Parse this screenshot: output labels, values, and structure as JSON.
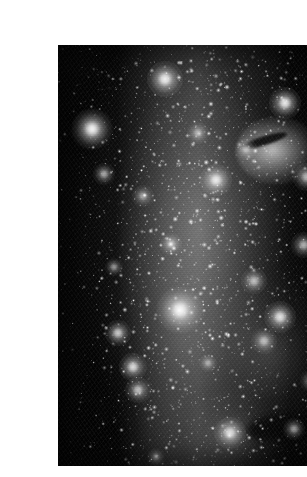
{
  "page": {
    "background_color": "#ffffff",
    "width": 307,
    "height": 477
  },
  "figure": {
    "name": "astronomical-star-field",
    "caption": "",
    "media_type": "grayscale astronomical photograph",
    "frame": {
      "x": 18,
      "y": 29,
      "width": 270,
      "height": 421
    },
    "palette": {
      "sky_background": "#050505",
      "nebula_glow": "#8c8c8c",
      "star_core": "#ffffff",
      "dark_lane": "#050505",
      "page_white": "#ffffff"
    },
    "features": [
      {
        "name": "central-milky-band",
        "x_pct": 52,
        "y_pct": 44,
        "brightness": "bright"
      },
      {
        "name": "hii-knot-upper-right",
        "x_pct": 80,
        "y_pct": 25,
        "brightness": "brightest"
      },
      {
        "name": "dark-absorption-lane",
        "x_pct": 76,
        "y_pct": 23,
        "brightness": "dark"
      },
      {
        "name": "bright-star-center",
        "x_pct": 45,
        "y_pct": 55,
        "brightness": "brightest"
      },
      {
        "name": "star-cluster-lower-left",
        "x_pct": 27,
        "y_pct": 77,
        "brightness": "bright"
      },
      {
        "name": "diffuse-patch-lower-center",
        "x_pct": 64,
        "y_pct": 92,
        "brightness": "bright"
      },
      {
        "name": "dark-region-lower-left",
        "x_pct": 10,
        "y_pct": 86,
        "brightness": "dark"
      }
    ]
  },
  "chart_data": {
    "type": "scatter",
    "title": "",
    "xlabel": "",
    "ylabel": "",
    "grid": false,
    "legend_position": "none",
    "xlim": [
      0,
      270
    ],
    "ylim": [
      0,
      421
    ],
    "series": [
      {
        "name": "bright-stars",
        "points": [
          {
            "x": 34,
            "y": 84,
            "mag": 1.0,
            "size": 11
          },
          {
            "x": 107,
            "y": 34,
            "mag": 0.95,
            "size": 10
          },
          {
            "x": 227,
            "y": 58,
            "mag": 0.92,
            "size": 9
          },
          {
            "x": 122,
            "y": 265,
            "mag": 1.0,
            "size": 13
          },
          {
            "x": 158,
            "y": 135,
            "mag": 0.9,
            "size": 9
          },
          {
            "x": 75,
            "y": 322,
            "mag": 0.85,
            "size": 8
          },
          {
            "x": 222,
            "y": 272,
            "mag": 0.88,
            "size": 9
          },
          {
            "x": 172,
            "y": 388,
            "mag": 0.86,
            "size": 9
          },
          {
            "x": 249,
            "y": 132,
            "mag": 0.8,
            "size": 8
          },
          {
            "x": 60,
            "y": 288,
            "mag": 0.78,
            "size": 7
          },
          {
            "x": 246,
            "y": 200,
            "mag": 0.74,
            "size": 7
          },
          {
            "x": 196,
            "y": 236,
            "mag": 0.7,
            "size": 7
          },
          {
            "x": 80,
            "y": 345,
            "mag": 0.72,
            "size": 7
          },
          {
            "x": 113,
            "y": 199,
            "mag": 0.66,
            "size": 6
          },
          {
            "x": 46,
            "y": 129,
            "mag": 0.64,
            "size": 6
          },
          {
            "x": 206,
            "y": 296,
            "mag": 0.68,
            "size": 7
          },
          {
            "x": 253,
            "y": 336,
            "mag": 0.62,
            "size": 6
          },
          {
            "x": 140,
            "y": 88,
            "mag": 0.6,
            "size": 6
          },
          {
            "x": 85,
            "y": 151,
            "mag": 0.58,
            "size": 6
          },
          {
            "x": 188,
            "y": 104,
            "mag": 0.62,
            "size": 6
          },
          {
            "x": 236,
            "y": 384,
            "mag": 0.58,
            "size": 6
          },
          {
            "x": 56,
            "y": 222,
            "mag": 0.55,
            "size": 5
          },
          {
            "x": 150,
            "y": 318,
            "mag": 0.55,
            "size": 5
          },
          {
            "x": 98,
            "y": 412,
            "mag": 0.52,
            "size": 5
          },
          {
            "x": 262,
            "y": 246,
            "mag": 0.52,
            "size": 5
          }
        ]
      },
      {
        "name": "field-stars",
        "count": 2600,
        "description": "uniformly scattered faint point sources across the full frame, densest along the central vertical band"
      }
    ]
  }
}
